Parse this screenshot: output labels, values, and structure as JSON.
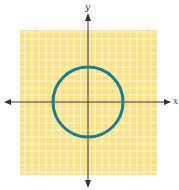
{
  "chart_data": {
    "type": "line",
    "title": "",
    "xlabel": "x",
    "ylabel": "y",
    "xlim": [
      -10,
      10
    ],
    "ylim": [
      -10,
      10
    ],
    "grid": true,
    "grid_step": 1,
    "series": [
      {
        "name": "circle",
        "shape": "circle",
        "center": [
          0,
          0
        ],
        "radius": 5,
        "color": "#1f7a8c"
      }
    ]
  },
  "axes": {
    "x_label": "x",
    "y_label": "y"
  },
  "colors": {
    "grid_bg": "#f9e28a",
    "grid_line": "#fdf3c8",
    "curve": "#1f7a8c",
    "axis": "#333333"
  }
}
